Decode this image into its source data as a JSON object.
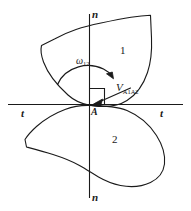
{
  "figure": {
    "background_color": "#ffffff",
    "stroke_color": "#1a1a1a",
    "width": 191,
    "height": 211
  },
  "axes": {
    "normal_axis": {
      "name": "normal-axis",
      "orientation": "vertical",
      "label_top": "n",
      "label_bottom": "n"
    },
    "tangent_axis": {
      "name": "tangent-axis",
      "orientation": "horizontal",
      "label_left": "t",
      "label_right": "t"
    }
  },
  "contact_point": {
    "label": "A"
  },
  "bodies": [
    {
      "id": "body-1",
      "label": "1",
      "position": "upper"
    },
    {
      "id": "body-2",
      "label": "2",
      "position": "lower"
    }
  ],
  "annotations": {
    "angular_velocity": {
      "symbol": "ω",
      "subscript": "12",
      "direction": "clockwise"
    },
    "relative_velocity": {
      "symbol": "V",
      "subscript": "A1A2",
      "direction": "leftward along tangent"
    },
    "right_angle_marker": {
      "name": "right-angle-marker",
      "visible": true
    }
  }
}
